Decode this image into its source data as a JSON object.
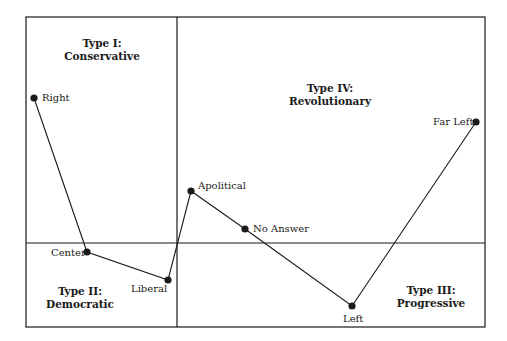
{
  "quadrants": [
    {
      "id": "I",
      "title": "Type I:",
      "subtitle": "Conservative",
      "x": 102,
      "y": 37
    },
    {
      "id": "II",
      "title": "Type II:",
      "subtitle": "Democratic",
      "x": 80,
      "y": 285
    },
    {
      "id": "III",
      "title": "Type III:",
      "subtitle": "Progressive",
      "x": 431,
      "y": 284
    },
    {
      "id": "IV",
      "title": "Type IV:",
      "subtitle": "Revolutionary",
      "x": 330,
      "y": 82
    }
  ],
  "points": [
    {
      "label": "Right",
      "x": 34,
      "y": 98,
      "lx": 42,
      "ly": 92
    },
    {
      "label": "Center",
      "x": 87,
      "y": 252,
      "lx": 51,
      "ly": 247
    },
    {
      "label": "Liberal",
      "x": 168,
      "y": 280,
      "lx": 131,
      "ly": 283
    },
    {
      "label": "Apolitical",
      "x": 191,
      "y": 191,
      "lx": 198,
      "ly": 180
    },
    {
      "label": "No Answer",
      "x": 245,
      "y": 229,
      "lx": 253,
      "ly": 223
    },
    {
      "label": "Left",
      "x": 352,
      "y": 306,
      "lx": 343,
      "ly": 313
    },
    {
      "label": "Far Left",
      "x": 476,
      "y": 122,
      "lx": 433,
      "ly": 116
    }
  ],
  "frame": {
    "left": 26,
    "top": 17,
    "right": 485,
    "bottom": 327,
    "vdivider_x": 177,
    "hdivider_y": 243
  },
  "colors": {
    "line": "#1a1a1a",
    "background": "#ffffff"
  }
}
